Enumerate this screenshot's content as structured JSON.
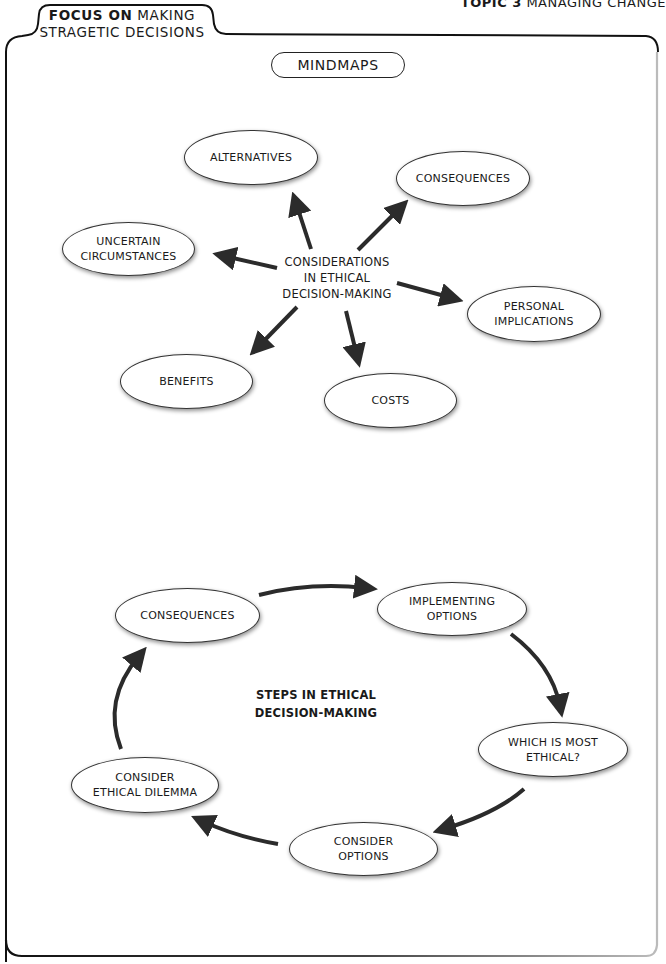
{
  "header": {
    "tab_bold": "FOCUS ON",
    "tab_rest_line1": "MAKING",
    "tab_line2": "STRAGETIC DECISIONS",
    "topic_bold": "TOPIC 3",
    "topic_rest": "MANAGING CHANGE"
  },
  "section_title": "MINDMAPS",
  "mindmap1": {
    "center": [
      "CONSIDERATIONS",
      "IN ETHICAL",
      "DECISION-MAKING"
    ],
    "nodes": [
      {
        "id": "alternatives",
        "lines": [
          "ALTERNATIVES"
        ]
      },
      {
        "id": "consequences",
        "lines": [
          "CONSEQUENCES"
        ]
      },
      {
        "id": "uncertain-circumstances",
        "lines": [
          "UNCERTAIN",
          "CIRCUMSTANCES"
        ]
      },
      {
        "id": "personal-implications",
        "lines": [
          "PERSONAL",
          "IMPLICATIONS"
        ]
      },
      {
        "id": "benefits",
        "lines": [
          "BENEFITS"
        ]
      },
      {
        "id": "costs",
        "lines": [
          "COSTS"
        ]
      }
    ]
  },
  "mindmap2": {
    "center": [
      "STEPS IN ETHICAL",
      "DECISION-MAKING"
    ],
    "nodes": [
      {
        "id": "consequences",
        "lines": [
          "CONSEQUENCES"
        ]
      },
      {
        "id": "implementing-options",
        "lines": [
          "IMPLEMENTING",
          "OPTIONS"
        ]
      },
      {
        "id": "which-is-most-ethical",
        "lines": [
          "WHICH IS MOST",
          "ETHICAL?"
        ]
      },
      {
        "id": "consider-options",
        "lines": [
          "CONSIDER",
          "OPTIONS"
        ]
      },
      {
        "id": "consider-ethical-dilemma",
        "lines": [
          "CONSIDER",
          "ETHICAL DILEMMA"
        ]
      }
    ],
    "cycle_order": [
      "consider-ethical-dilemma",
      "consequences",
      "implementing-options",
      "which-is-most-ethical",
      "consider-options",
      "consider-ethical-dilemma"
    ]
  },
  "colors": {
    "stroke": "#222222",
    "arrow": "#2b2b2b",
    "node_fill": "#ffffff",
    "background": "#ffffff"
  }
}
